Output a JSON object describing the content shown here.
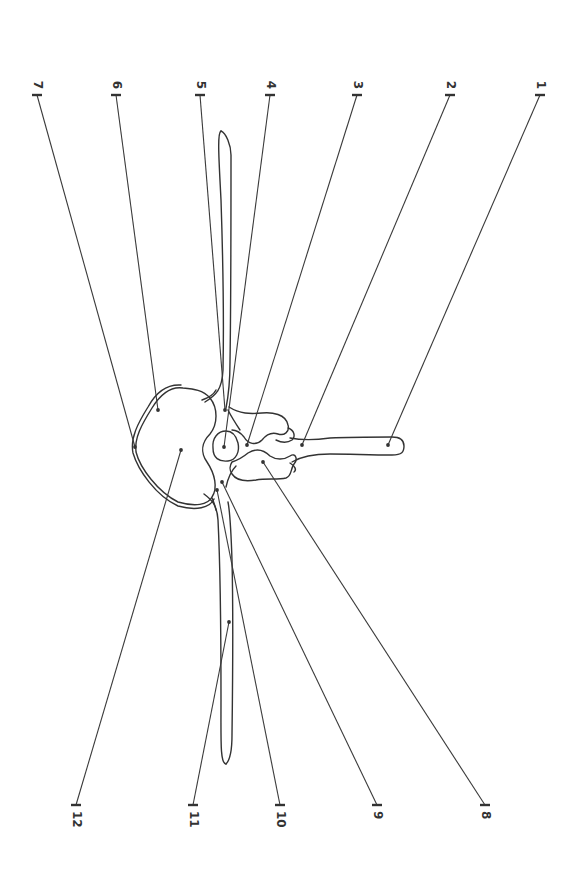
{
  "diagram": {
    "orientation": "rotated-90",
    "colors": {
      "line": "#333333",
      "background": "#ffffff"
    },
    "labels_top": [
      {
        "id": "7",
        "text": "7",
        "tick": [
          37,
          95
        ],
        "point": [
          135,
          447
        ]
      },
      {
        "id": "6",
        "text": "6",
        "tick": [
          116,
          95
        ],
        "point": [
          158,
          410
        ]
      },
      {
        "id": "5",
        "text": "5",
        "tick": [
          200,
          95
        ],
        "point": [
          225,
          410
        ]
      },
      {
        "id": "4",
        "text": "4",
        "tick": [
          270,
          95
        ],
        "point": [
          224,
          447
        ]
      },
      {
        "id": "3",
        "text": "3",
        "tick": [
          357,
          95
        ],
        "point": [
          247,
          445
        ]
      },
      {
        "id": "2",
        "text": "2",
        "tick": [
          450,
          95
        ],
        "point": [
          302,
          445
        ]
      },
      {
        "id": "1",
        "text": "1",
        "tick": [
          540,
          95
        ],
        "point": [
          388,
          445
        ]
      }
    ],
    "labels_bottom": [
      {
        "id": "12",
        "text": "12",
        "tick": [
          76,
          805
        ],
        "point": [
          181,
          450
        ]
      },
      {
        "id": "11",
        "text": "11",
        "tick": [
          193,
          805
        ],
        "point": [
          229,
          622
        ]
      },
      {
        "id": "10",
        "text": "10",
        "tick": [
          280,
          805
        ],
        "point": [
          217,
          490
        ]
      },
      {
        "id": "9",
        "text": "9",
        "tick": [
          377,
          805
        ],
        "point": [
          222,
          482
        ]
      },
      {
        "id": "8",
        "text": "8",
        "tick": [
          485,
          805
        ],
        "point": [
          263,
          462
        ]
      }
    ]
  }
}
